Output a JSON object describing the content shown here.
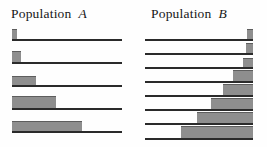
{
  "figure": {
    "background_color": "#fefefe",
    "bar_color": "#8e8e8e",
    "bar_edge_color": "#5d5d5d",
    "axis_color": "#2a2a2a"
  },
  "panels": [
    {
      "id": "population-a",
      "title_word": "Population",
      "title_symbol": "A",
      "anchor": "left",
      "axis_left": 12,
      "axis_width": 110,
      "rows": [
        {
          "baseline_y": 41,
          "bar_width": 5,
          "bar_height": 10
        },
        {
          "baseline_y": 64,
          "bar_width": 9,
          "bar_height": 11
        },
        {
          "baseline_y": 87,
          "bar_width": 24,
          "bar_height": 9
        },
        {
          "baseline_y": 110,
          "bar_width": 44,
          "bar_height": 12
        },
        {
          "baseline_y": 133,
          "bar_width": 70,
          "bar_height": 10
        }
      ]
    },
    {
      "id": "population-b",
      "title_word": "Population",
      "title_symbol": "B",
      "anchor": "right",
      "axis_left": 12,
      "axis_width": 108,
      "rows": [
        {
          "baseline_y": 41,
          "bar_width": 6,
          "bar_height": 10
        },
        {
          "baseline_y": 55,
          "bar_width": 7,
          "bar_height": 10
        },
        {
          "baseline_y": 69,
          "bar_width": 10,
          "bar_height": 9
        },
        {
          "baseline_y": 83,
          "bar_width": 20,
          "bar_height": 11
        },
        {
          "baseline_y": 97,
          "bar_width": 30,
          "bar_height": 11
        },
        {
          "baseline_y": 111,
          "bar_width": 42,
          "bar_height": 11
        },
        {
          "baseline_y": 125,
          "bar_width": 56,
          "bar_height": 11
        },
        {
          "baseline_y": 140,
          "bar_width": 72,
          "bar_height": 12
        }
      ]
    }
  ],
  "chart_data": {
    "type": "bar",
    "xlabel": "",
    "ylabel": "",
    "orientation": "horizontal",
    "grid": false,
    "legend": null,
    "annotations": [
      "Population A",
      "Population B"
    ],
    "series": [
      {
        "name": "Population A",
        "anchor": "left",
        "axis_span": 110,
        "categories": [
          "1",
          "2",
          "3",
          "4",
          "5"
        ],
        "values": [
          5,
          9,
          24,
          44,
          70
        ]
      },
      {
        "name": "Population B",
        "anchor": "right",
        "axis_span": 108,
        "categories": [
          "1",
          "2",
          "3",
          "4",
          "5",
          "6",
          "7",
          "8"
        ],
        "values": [
          6,
          7,
          10,
          20,
          30,
          42,
          56,
          72
        ]
      }
    ]
  }
}
